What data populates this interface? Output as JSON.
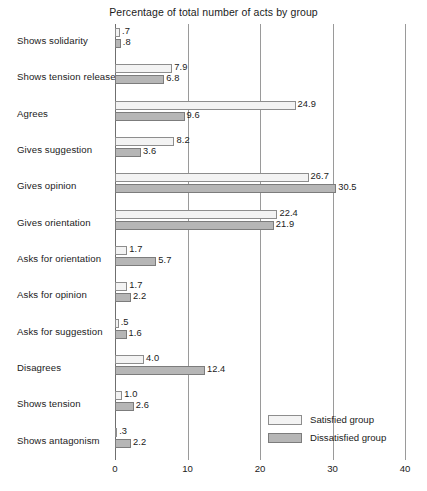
{
  "chart_data": {
    "type": "bar",
    "orientation": "horizontal",
    "title": "Percentage of total number of acts by group",
    "xlabel": "",
    "ylabel": "",
    "xlim": [
      0,
      40
    ],
    "xticks": [
      "0",
      "10",
      "20",
      "30",
      "40"
    ],
    "xtick_values": [
      0,
      10,
      20,
      30,
      40
    ],
    "grid": true,
    "grid_axis": "x",
    "legend_position": "bottom-right",
    "categories": [
      "Shows solidarity",
      "Shows tension release",
      "Agrees",
      "Gives suggestion",
      "Gives opinion",
      "Gives orientation",
      "Asks for orientation",
      "Asks for opinion",
      "Asks for suggestion",
      "Disagrees",
      "Shows tension",
      "Shows antagonism"
    ],
    "series": [
      {
        "name": "Satisfied group",
        "color": "#f3f3f3",
        "values": [
          0.7,
          7.9,
          24.9,
          8.2,
          26.7,
          22.4,
          1.7,
          1.7,
          0.5,
          4.0,
          1.0,
          0.3
        ],
        "labels": [
          ".7",
          "7.9",
          "24.9",
          "8.2",
          "26.7",
          "22.4",
          "1.7",
          "1.7",
          ".5",
          "4.0",
          "1.0",
          ".3"
        ]
      },
      {
        "name": "Dissatisfied group",
        "color": "#b6b6b6",
        "values": [
          0.8,
          6.8,
          9.6,
          3.6,
          30.5,
          21.9,
          5.7,
          2.2,
          1.6,
          12.4,
          2.6,
          2.2
        ],
        "labels": [
          ".8",
          "6.8",
          "9.6",
          "3.6",
          "30.5",
          "21.9",
          "5.7",
          "2.2",
          "1.6",
          "12.4",
          "2.6",
          "2.2"
        ]
      }
    ]
  },
  "legend": {
    "items": [
      {
        "label": "Satisfied group",
        "key": "satisfied"
      },
      {
        "label": "Dissatisfied group",
        "key": "dissatisfied"
      }
    ]
  }
}
